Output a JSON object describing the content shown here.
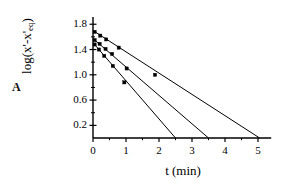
{
  "figure": {
    "panel_label": "A",
    "background_color": "#ffffff",
    "ink_color": "#000000"
  },
  "chart_data": {
    "type": "line",
    "title": "",
    "subtitle": "",
    "panel": "A",
    "xlabel": "t (min)",
    "ylabel": "log(x'-x'eq)",
    "ylabel_base": "log(x'-x'",
    "ylabel_sub": "eq",
    "ylabel_tail": ")",
    "grid": false,
    "legend": "none",
    "xlim": [
      0,
      5.4
    ],
    "ylim": [
      0,
      1.9
    ],
    "xticks": [
      0,
      1,
      2,
      3,
      4,
      5
    ],
    "xtick_labels": [
      "0",
      "1",
      "2",
      "3",
      "4",
      "5"
    ],
    "xminor_ticks": [
      0.5,
      1.5,
      2.5,
      3.5,
      4.5
    ],
    "yticks": [
      0.2,
      0.6,
      1.0,
      1.4,
      1.8
    ],
    "ytick_labels": [
      "0.2",
      "0.6",
      "1.0",
      "1.4",
      "1.8"
    ],
    "yminor_ticks": [
      0.4,
      0.8,
      1.2,
      1.6
    ],
    "marker": "filled-square",
    "series": [
      {
        "name": "slowest-decay",
        "x_intercept": 5.05,
        "points": [
          {
            "x": 0.05,
            "y": 1.68
          },
          {
            "x": 0.22,
            "y": 1.62
          },
          {
            "x": 0.4,
            "y": 1.56
          },
          {
            "x": 0.78,
            "y": 1.43
          },
          {
            "x": 1.88,
            "y": 1.0
          }
        ],
        "line": [
          [
            0.03,
            1.69
          ],
          [
            5.05,
            0.0
          ]
        ]
      },
      {
        "name": "intermediate-decay",
        "x_intercept": 3.5,
        "points": [
          {
            "x": 0.05,
            "y": 1.55
          },
          {
            "x": 0.2,
            "y": 1.49
          },
          {
            "x": 0.38,
            "y": 1.41
          },
          {
            "x": 0.58,
            "y": 1.33
          },
          {
            "x": 1.02,
            "y": 1.1
          }
        ],
        "line": [
          [
            0.03,
            1.56
          ],
          [
            3.5,
            0.0
          ]
        ]
      },
      {
        "name": "fastest-decay",
        "x_intercept": 2.5,
        "points": [
          {
            "x": 0.05,
            "y": 1.48
          },
          {
            "x": 0.18,
            "y": 1.4
          },
          {
            "x": 0.34,
            "y": 1.3
          },
          {
            "x": 0.6,
            "y": 1.14
          },
          {
            "x": 0.95,
            "y": 0.88
          }
        ],
        "line": [
          [
            0.03,
            1.49
          ],
          [
            2.5,
            0.0
          ]
        ]
      }
    ]
  }
}
